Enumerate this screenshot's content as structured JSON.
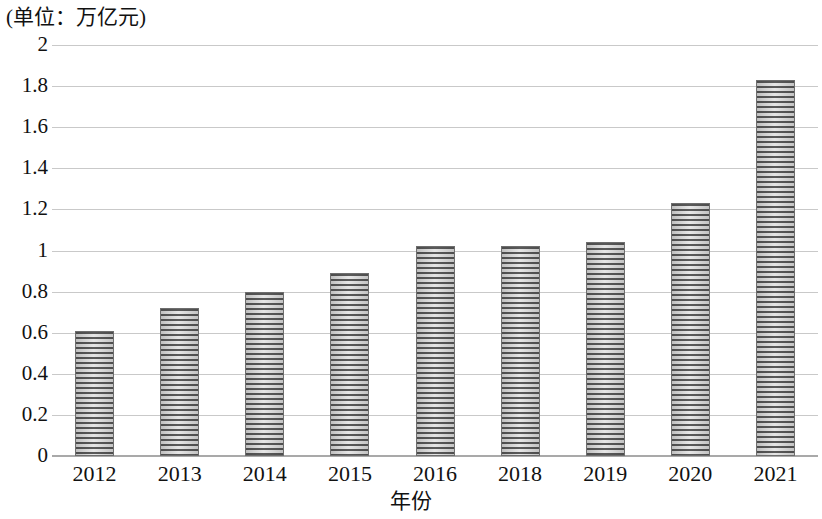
{
  "chart_data": {
    "type": "bar",
    "title": "(单位：万亿元)",
    "xlabel": "年份",
    "ylabel": "",
    "categories": [
      "2012",
      "2013",
      "2014",
      "2015",
      "2016",
      "2018",
      "2019",
      "2020",
      "2021"
    ],
    "values": [
      0.61,
      0.72,
      0.8,
      0.89,
      1.02,
      1.02,
      1.04,
      1.23,
      1.83
    ],
    "ylim": [
      0,
      2
    ],
    "ytick_labels": [
      "2",
      "1.8",
      "1.6",
      "1.4",
      "1.2",
      "1",
      "0.8",
      "0.6",
      "0.4",
      "0.2",
      "0"
    ],
    "ytick_values": [
      2,
      1.8,
      1.6,
      1.4,
      1.2,
      1,
      0.8,
      0.6,
      0.4,
      0.2,
      0
    ],
    "grid": true,
    "legend": null,
    "legend_position": "none",
    "bar_color": "#8d8d8d",
    "bar_edge_color": "#6e6e6e",
    "gridline_color": "#c9c9c9",
    "axis_color": "#a9a9a9",
    "background_color": "#ffffff"
  }
}
